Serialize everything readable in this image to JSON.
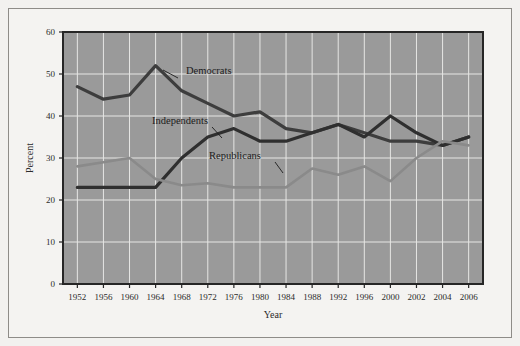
{
  "figure": {
    "background_color": "#f4f3f1",
    "plot_background_color": "#9a9a9a",
    "frame_color": "#8e8c88"
  },
  "chart_data": {
    "type": "line",
    "title": "",
    "subtitle": "",
    "xlabel": "Year",
    "ylabel": "Percent",
    "grid": true,
    "legend_position": "inline-annotations",
    "xlim": [
      1952,
      2006
    ],
    "ylim": [
      0,
      60
    ],
    "ytick_labels": [
      "0",
      "10",
      "20",
      "30",
      "40",
      "50",
      "60"
    ],
    "ytick_values": [
      0,
      10,
      20,
      30,
      40,
      50,
      60
    ],
    "categories": [
      "1952",
      "1956",
      "1960",
      "1964",
      "1968",
      "1972",
      "1976",
      "1980",
      "1984",
      "1988",
      "1992",
      "1996",
      "2000",
      "2002",
      "2004",
      "2006"
    ],
    "series": [
      {
        "name": "Democrats",
        "color": "#3d3d3d",
        "values": [
          47,
          44,
          45,
          52,
          46,
          43,
          40,
          41,
          37,
          36,
          38,
          36,
          34,
          34,
          33,
          35
        ]
      },
      {
        "name": "Independents",
        "color": "#2f2f2f",
        "values": [
          23,
          23,
          23,
          23,
          30,
          35,
          37,
          34,
          34,
          36,
          38,
          35,
          40,
          36,
          33,
          35
        ]
      },
      {
        "name": "Republicans",
        "color": "#8a8a8a",
        "values": [
          28,
          29,
          30,
          25,
          23.5,
          24,
          23,
          23,
          23,
          27.5,
          26,
          28,
          24.5,
          30,
          34,
          33
        ]
      }
    ],
    "annotations": [
      {
        "text": "Democrats",
        "x": 1966,
        "y": 47.0
      },
      {
        "text": "Independents",
        "x": 1962,
        "y": 35.0
      },
      {
        "text": "Republicans",
        "x": 1976,
        "y": 28.0
      }
    ]
  }
}
